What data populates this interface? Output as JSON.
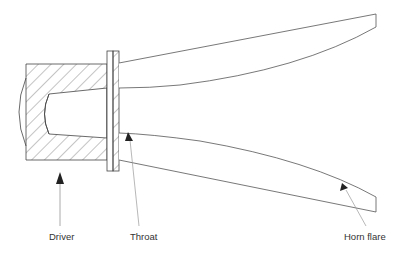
{
  "diagram": {
    "type": "horn loudspeaker cross-section",
    "colors": {
      "stroke": "#444444",
      "hatch": "#555555",
      "arrow": "#222222",
      "leader": "#999999",
      "label": "#333333",
      "background": "#ffffff"
    },
    "labels": {
      "driver": "Driver",
      "throat": "Throat",
      "horn_flare": "Horn flare"
    }
  }
}
